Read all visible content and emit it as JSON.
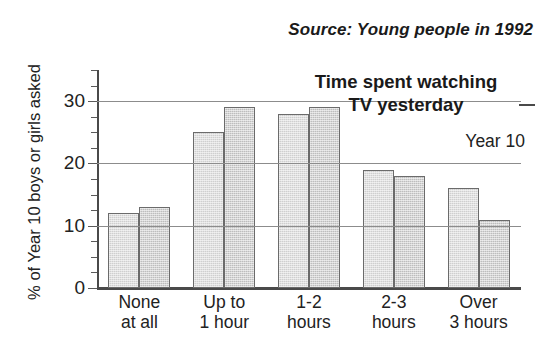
{
  "source_note": "Source: Young people in 1992",
  "y_axis_title": "% of Year 10 boys or girls asked",
  "title_line1": "Time spent watching",
  "title_line2": "TV yesterday",
  "legend_year": "Year 10",
  "x_labels": [
    {
      "line1": "None",
      "line2": "at all"
    },
    {
      "line1": "Up to",
      "line2": "1 hour"
    },
    {
      "line1": "1-2",
      "line2": "hours"
    },
    {
      "line1": "2-3",
      "line2": "hours"
    },
    {
      "line1": "Over",
      "line2": "3 hours"
    }
  ],
  "y_ticks": [
    "0",
    "10",
    "20",
    "30"
  ],
  "colors": {
    "boys_bar": "#cfcfcf",
    "girls_bar": "#bdbdbd",
    "bar_outline": "#6b6b6b",
    "gridline": "#8c8c8c",
    "axis": "#4a4a4a",
    "text": "#1a1a1a",
    "background": "#ffffff"
  },
  "chart_data": {
    "type": "bar",
    "title": "Time spent watching TV yesterday",
    "subtitle": "Year 10",
    "annotation": "Source: Young people in 1992",
    "xlabel": "",
    "ylabel": "% of Year 10 boys or girls asked",
    "categories": [
      "None at all",
      "Up to 1 hour",
      "1-2 hours",
      "2-3 hours",
      "Over 3 hours"
    ],
    "series": [
      {
        "name": "boys",
        "values": [
          12,
          25,
          28,
          19,
          16
        ]
      },
      {
        "name": "girls",
        "values": [
          13,
          29,
          29,
          18,
          11
        ]
      }
    ],
    "ylim": [
      0,
      35
    ],
    "yticks": [
      0,
      10,
      20,
      30
    ],
    "yminor_step": 2.5,
    "grid": true,
    "grid_axis": "y",
    "legend": false,
    "legend_position": "none"
  }
}
